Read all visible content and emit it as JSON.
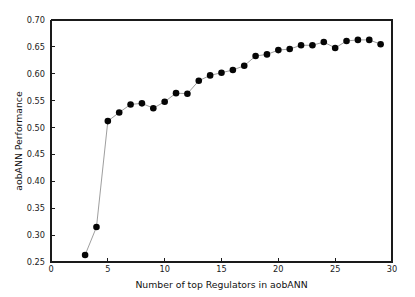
{
  "chart_data": {
    "type": "line",
    "title": "",
    "xlabel": "Number of top Regulators in aobANN",
    "ylabel": "aobANN Performance",
    "xlim": [
      0,
      30
    ],
    "ylim": [
      0.25,
      0.7
    ],
    "xticks": [
      0,
      5,
      10,
      15,
      20,
      25,
      30
    ],
    "xtick_labels": [
      "0",
      "5",
      "10",
      "15",
      "20",
      "25",
      "30"
    ],
    "yticks": [
      0.25,
      0.3,
      0.35,
      0.4,
      0.45,
      0.5,
      0.55,
      0.6,
      0.65,
      0.7
    ],
    "ytick_labels": [
      "0.25",
      "0.30",
      "0.35",
      "0.40",
      "0.45",
      "0.50",
      "0.55",
      "0.60",
      "0.65",
      "0.70"
    ],
    "grid": false,
    "legend": null,
    "marker": "filled-circle",
    "marker_color": "#050505",
    "line_color": "#8c8c8c",
    "x": [
      3,
      4,
      5,
      6,
      7,
      8,
      9,
      10,
      11,
      12,
      13,
      14,
      15,
      16,
      17,
      18,
      19,
      20,
      21,
      22,
      23,
      24,
      25,
      26,
      27,
      28,
      29
    ],
    "values": [
      0.263,
      0.315,
      0.512,
      0.528,
      0.543,
      0.545,
      0.536,
      0.548,
      0.564,
      0.563,
      0.587,
      0.597,
      0.602,
      0.607,
      0.615,
      0.633,
      0.636,
      0.644,
      0.646,
      0.653,
      0.653,
      0.659,
      0.648,
      0.661,
      0.663,
      0.663,
      0.655
    ]
  }
}
